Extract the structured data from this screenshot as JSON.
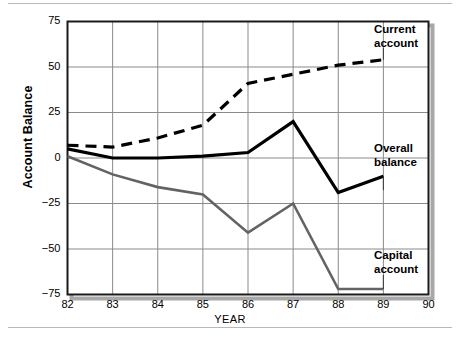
{
  "chart_data": {
    "type": "line",
    "title": "",
    "xlabel": "YEAR",
    "ylabel": "Account Balance",
    "x": [
      82,
      83,
      84,
      85,
      86,
      87,
      88,
      89
    ],
    "xlim": [
      82,
      90
    ],
    "ylim": [
      -75,
      75
    ],
    "xticks": [
      "82",
      "83",
      "84",
      "85",
      "86",
      "87",
      "88",
      "89",
      "90"
    ],
    "yticks": [
      "75",
      "50",
      "25",
      "0",
      "−25",
      "−50",
      "−75"
    ],
    "grid": true,
    "legend_position": "inline-right-annotations",
    "series": [
      {
        "name": "Current account",
        "style": "dashed",
        "color": "#000000",
        "values": [
          7,
          6,
          11,
          18,
          41,
          46,
          51,
          54
        ]
      },
      {
        "name": "Overall balance",
        "style": "solid",
        "color": "#000000",
        "values": [
          5,
          0,
          0,
          1,
          3,
          20,
          -19,
          -10
        ]
      },
      {
        "name": "Capital account",
        "style": "solid",
        "color": "#636363",
        "values": [
          1,
          -9,
          -16,
          -20,
          -41,
          -25,
          -72,
          -72
        ]
      }
    ],
    "annotations": [
      {
        "name": "current-account-label",
        "text_line1": "Current",
        "text_line2": "account"
      },
      {
        "name": "overall-balance-label",
        "text_line1": "Overall",
        "text_line2": "balance"
      },
      {
        "name": "capital-account-label",
        "text_line1": "Capital",
        "text_line2": "account"
      }
    ]
  },
  "axis": {
    "ylabel": "Account Balance",
    "xlabel": "YEAR"
  }
}
